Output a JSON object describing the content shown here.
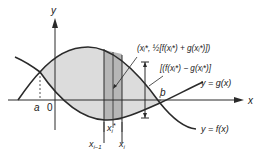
{
  "diagram": {
    "type": "area-between-curves",
    "axes": {
      "x_label": "x",
      "y_label": "y",
      "origin_label": "0"
    },
    "curves": [
      {
        "name": "f",
        "label": "y = f(x)"
      },
      {
        "name": "g",
        "label": "y = g(x)"
      }
    ],
    "points": {
      "a_label": "a",
      "b_label": "b"
    },
    "strip": {
      "left_label": "x",
      "left_sub": "i−1",
      "right_label": "x",
      "right_sub": "i",
      "sample_label": "x",
      "sample_sub": "i",
      "sample_sup": "*"
    },
    "annotations": {
      "midpoint": "(xᵢ*, ½[f(xᵢ*) + g(xᵢ*)])",
      "height": "[(f(xᵢ*) − g(xᵢ*)]"
    },
    "colors": {
      "region_fill": "#dcdcdc",
      "strip_fill": "#b8b8b8",
      "line": "#2a2a2a"
    }
  }
}
